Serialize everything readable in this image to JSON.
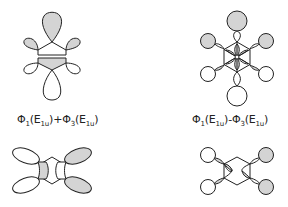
{
  "figure": {
    "panels": [
      {
        "id": "top-left",
        "description": "Combined orbital lobes on a six-membered ring, sum combination",
        "label": {
          "phi1": "Φ",
          "sub1": "1",
          "arg1_pre": "(E",
          "arg1_sub": "1u",
          "arg1_post": ")",
          "op": "+",
          "phi2": "Φ",
          "sub2": "3",
          "arg2_pre": "(E",
          "arg2_sub": "1u",
          "arg2_post": ")"
        }
      },
      {
        "id": "top-right",
        "description": "Combined orbital lobes on a six-membered ring, difference combination",
        "label": {
          "phi1": "Φ",
          "sub1": "1",
          "arg1_pre": "(E",
          "arg1_sub": "1u",
          "arg1_post": ")",
          "op": "-",
          "phi2": "Φ",
          "sub2": "3",
          "arg2_pre": "(E",
          "arg2_sub": "1u",
          "arg2_post": ")"
        }
      },
      {
        "id": "bottom-left",
        "description": "Side-on ring with four elongated lobes, right pair shaded"
      },
      {
        "id": "bottom-right",
        "description": "Side-on ring with four circular lobes, right pair shaded"
      }
    ],
    "colors": {
      "shaded": "#d4d4d4",
      "outline": "#222222",
      "background": "#ffffff"
    }
  }
}
